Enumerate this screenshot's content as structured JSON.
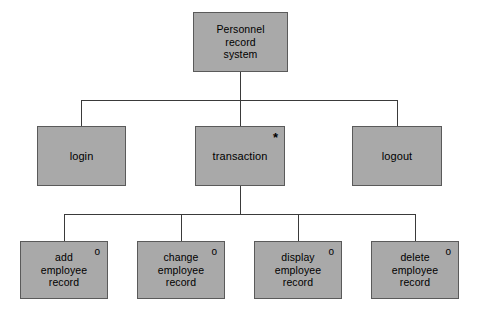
{
  "diagram": {
    "type": "hierarchy-chart",
    "nodes": [
      {
        "id": "root",
        "label": "Personnel\nrecord\nsystem",
        "marker": "",
        "level": 0
      },
      {
        "id": "login",
        "label": "login",
        "marker": "",
        "level": 1
      },
      {
        "id": "transaction",
        "label": "transaction",
        "marker": "*",
        "level": 1
      },
      {
        "id": "logout",
        "label": "logout",
        "marker": "",
        "level": 1
      },
      {
        "id": "add",
        "label": "add\nemployee\nrecord",
        "marker": "o",
        "level": 2
      },
      {
        "id": "change",
        "label": "change\nemployee\nrecord",
        "marker": "o",
        "level": 2
      },
      {
        "id": "display",
        "label": "display\nemployee\nrecord",
        "marker": "o",
        "level": 2
      },
      {
        "id": "delete",
        "label": "delete\nemployee\nrecord",
        "marker": "o",
        "level": 2
      }
    ],
    "colors": {
      "node_fill": "#a9a9a9",
      "node_border": "#5a5a5a",
      "edge": "#3a3a3a",
      "background": "#ffffff",
      "text": "#000000"
    }
  }
}
